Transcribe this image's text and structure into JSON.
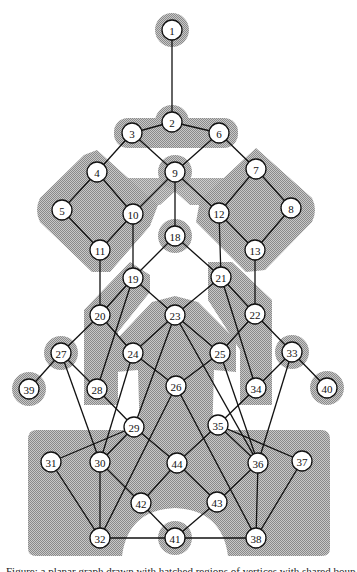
{
  "figure": {
    "colors": {
      "shade": "#9a9a9a",
      "shade_light": "#c4c4c4",
      "edge": "#111111",
      "node_fill": "#ffffff"
    },
    "nodes": [
      {
        "id": "1",
        "x": 172,
        "y": 30,
        "halo": true
      },
      {
        "id": "2",
        "x": 172,
        "y": 122,
        "halo": true
      },
      {
        "id": "3",
        "x": 132,
        "y": 133,
        "halo": false
      },
      {
        "id": "4",
        "x": 97,
        "y": 172,
        "halo": false
      },
      {
        "id": "5",
        "x": 62,
        "y": 210,
        "halo": false
      },
      {
        "id": "6",
        "x": 219,
        "y": 133,
        "halo": false
      },
      {
        "id": "7",
        "x": 256,
        "y": 169,
        "halo": false
      },
      {
        "id": "8",
        "x": 291,
        "y": 208,
        "halo": false
      },
      {
        "id": "9",
        "x": 175,
        "y": 172,
        "halo": true
      },
      {
        "id": "10",
        "x": 133,
        "y": 214,
        "halo": false
      },
      {
        "id": "11",
        "x": 100,
        "y": 250,
        "halo": false
      },
      {
        "id": "12",
        "x": 219,
        "y": 213,
        "halo": false
      },
      {
        "id": "13",
        "x": 255,
        "y": 250,
        "halo": false
      },
      {
        "id": "18",
        "x": 175,
        "y": 236,
        "halo": true
      },
      {
        "id": "19",
        "x": 133,
        "y": 278,
        "halo": false
      },
      {
        "id": "20",
        "x": 100,
        "y": 315,
        "halo": false
      },
      {
        "id": "21",
        "x": 221,
        "y": 277,
        "halo": false
      },
      {
        "id": "22",
        "x": 255,
        "y": 314,
        "halo": false
      },
      {
        "id": "23",
        "x": 175,
        "y": 315,
        "halo": false
      },
      {
        "id": "24",
        "x": 133,
        "y": 353,
        "halo": false
      },
      {
        "id": "25",
        "x": 220,
        "y": 353,
        "halo": false
      },
      {
        "id": "26",
        "x": 176,
        "y": 386,
        "halo": false
      },
      {
        "id": "27",
        "x": 61,
        "y": 353,
        "halo": true
      },
      {
        "id": "28",
        "x": 97,
        "y": 389,
        "halo": false
      },
      {
        "id": "29",
        "x": 134,
        "y": 427,
        "halo": false
      },
      {
        "id": "30",
        "x": 100,
        "y": 462,
        "halo": false
      },
      {
        "id": "31",
        "x": 51,
        "y": 462,
        "halo": false
      },
      {
        "id": "32",
        "x": 100,
        "y": 538,
        "halo": false
      },
      {
        "id": "33",
        "x": 292,
        "y": 352,
        "halo": true
      },
      {
        "id": "34",
        "x": 256,
        "y": 388,
        "halo": false
      },
      {
        "id": "35",
        "x": 218,
        "y": 425,
        "halo": false
      },
      {
        "id": "36",
        "x": 258,
        "y": 463,
        "halo": false
      },
      {
        "id": "37",
        "x": 302,
        "y": 461,
        "halo": false
      },
      {
        "id": "38",
        "x": 256,
        "y": 538,
        "halo": false
      },
      {
        "id": "39",
        "x": 29,
        "y": 389,
        "halo": true
      },
      {
        "id": "40",
        "x": 327,
        "y": 388,
        "halo": true
      },
      {
        "id": "41",
        "x": 175,
        "y": 538,
        "halo": true
      },
      {
        "id": "42",
        "x": 141,
        "y": 503,
        "halo": false
      },
      {
        "id": "43",
        "x": 217,
        "y": 502,
        "halo": false
      },
      {
        "id": "44",
        "x": 177,
        "y": 463,
        "halo": false
      }
    ],
    "edges": [
      [
        "1",
        "2"
      ],
      [
        "2",
        "3"
      ],
      [
        "2",
        "6"
      ],
      [
        "3",
        "4"
      ],
      [
        "3",
        "9"
      ],
      [
        "6",
        "9"
      ],
      [
        "6",
        "7"
      ],
      [
        "4",
        "5"
      ],
      [
        "4",
        "10"
      ],
      [
        "9",
        "10"
      ],
      [
        "9",
        "12"
      ],
      [
        "9",
        "18"
      ],
      [
        "7",
        "12"
      ],
      [
        "7",
        "8"
      ],
      [
        "5",
        "11"
      ],
      [
        "10",
        "11"
      ],
      [
        "10",
        "19"
      ],
      [
        "12",
        "21"
      ],
      [
        "12",
        "13"
      ],
      [
        "8",
        "13"
      ],
      [
        "18",
        "19"
      ],
      [
        "18",
        "21"
      ],
      [
        "11",
        "20"
      ],
      [
        "13",
        "22"
      ],
      [
        "19",
        "20"
      ],
      [
        "19",
        "23"
      ],
      [
        "19",
        "28"
      ],
      [
        "21",
        "23"
      ],
      [
        "21",
        "22"
      ],
      [
        "21",
        "34"
      ],
      [
        "20",
        "27"
      ],
      [
        "20",
        "24"
      ],
      [
        "23",
        "24"
      ],
      [
        "23",
        "25"
      ],
      [
        "23",
        "29"
      ],
      [
        "23",
        "36"
      ],
      [
        "22",
        "25"
      ],
      [
        "22",
        "33"
      ],
      [
        "27",
        "39"
      ],
      [
        "27",
        "28"
      ],
      [
        "27",
        "30"
      ],
      [
        "24",
        "26"
      ],
      [
        "24",
        "30"
      ],
      [
        "25",
        "26"
      ],
      [
        "25",
        "36"
      ],
      [
        "33",
        "40"
      ],
      [
        "33",
        "34"
      ],
      [
        "33",
        "36"
      ],
      [
        "28",
        "29"
      ],
      [
        "26",
        "32"
      ],
      [
        "26",
        "38"
      ],
      [
        "34",
        "35"
      ],
      [
        "29",
        "31"
      ],
      [
        "29",
        "30"
      ],
      [
        "29",
        "44"
      ],
      [
        "35",
        "44"
      ],
      [
        "35",
        "36"
      ],
      [
        "35",
        "37"
      ],
      [
        "31",
        "32"
      ],
      [
        "30",
        "32"
      ],
      [
        "30",
        "42"
      ],
      [
        "44",
        "42"
      ],
      [
        "44",
        "43"
      ],
      [
        "36",
        "43"
      ],
      [
        "36",
        "38"
      ],
      [
        "37",
        "38"
      ],
      [
        "42",
        "41"
      ],
      [
        "43",
        "41"
      ],
      [
        "32",
        "41"
      ],
      [
        "41",
        "38"
      ]
    ]
  },
  "caption": {
    "text": "Figure: a planar graph drawn with hatched regions of vertices with shared boundaries"
  }
}
